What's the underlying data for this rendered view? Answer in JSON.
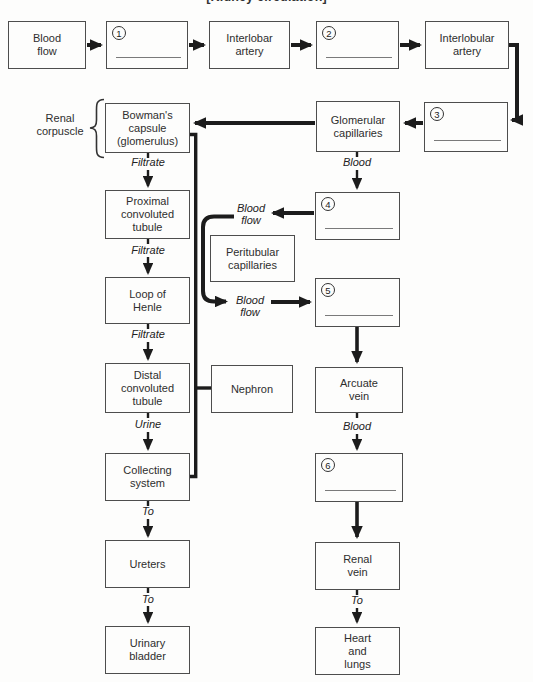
{
  "title": "[Kidney circulation]",
  "colors": {
    "line": "#1c1c1c",
    "box_border": "#4d4d4d",
    "blank_underline": "#7a7a7a",
    "background": "#fdfdfc"
  },
  "side_label": {
    "label": "Renal\ncorpuscle"
  },
  "boxes": {
    "blood_flow": {
      "label": "Blood\nflow"
    },
    "blank1": {
      "number": "1"
    },
    "interlobar_artery": {
      "label": "Interlobar\nartery"
    },
    "blank2": {
      "number": "2"
    },
    "interlobular_artery": {
      "label": "Interlobular\nartery"
    },
    "bowmans_capsule": {
      "label": "Bowman's\ncapsule\n(glomerulus)"
    },
    "glomerular_capillaries": {
      "label": "Glomerular\ncapillaries"
    },
    "blank3": {
      "number": "3"
    },
    "proximal_tubule": {
      "label": "Proximal\nconvoluted\ntubule"
    },
    "blank4": {
      "number": "4"
    },
    "peritubular_capillaries": {
      "label": "Peritubular\ncapillaries"
    },
    "loop_of_henle": {
      "label": "Loop of\nHenle"
    },
    "blank5": {
      "number": "5"
    },
    "distal_tubule": {
      "label": "Distal\nconvoluted\ntubule"
    },
    "nephron": {
      "label": "Nephron"
    },
    "arcuate_vein": {
      "label": "Arcuate\nvein"
    },
    "collecting_system": {
      "label": "Collecting\nsystem"
    },
    "blank6": {
      "number": "6"
    },
    "ureters": {
      "label": "Ureters"
    },
    "renal_vein": {
      "label": "Renal\nvein"
    },
    "urinary_bladder": {
      "label": "Urinary\nbladder"
    },
    "heart_lungs": {
      "label": "Heart\nand\nlungs"
    }
  },
  "flow_labels": {
    "filtrate1": "Filtrate",
    "filtrate2": "Filtrate",
    "filtrate3": "Filtrate",
    "urine": "Urine",
    "to1": "To",
    "to2": "To",
    "to3": "To",
    "blood1": "Blood",
    "blood2": "Blood",
    "blood_flow_upper": "Blood\nflow",
    "blood_flow_lower": "Blood\nflow"
  }
}
